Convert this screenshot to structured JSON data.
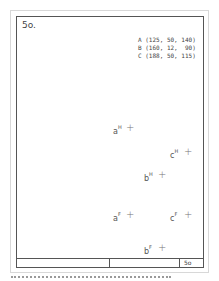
{
  "sheet": {
    "number": "5o.",
    "footer_label": "5o"
  },
  "given_points": [
    {
      "label": "A",
      "text": "A (125, 50, 140)"
    },
    {
      "label": "B",
      "text": "B (160, 12,  90)"
    },
    {
      "label": "C",
      "text": "C (188, 50, 115)"
    }
  ],
  "projections": {
    "aH": {
      "base": "a",
      "sup": "H"
    },
    "cH": {
      "base": "c",
      "sup": "H"
    },
    "bH": {
      "base": "b",
      "sup": "H"
    },
    "aF": {
      "base": "a",
      "sup": "F"
    },
    "cF": {
      "base": "c",
      "sup": "F"
    },
    "bF": {
      "base": "b",
      "sup": "F"
    }
  },
  "marker": "+"
}
